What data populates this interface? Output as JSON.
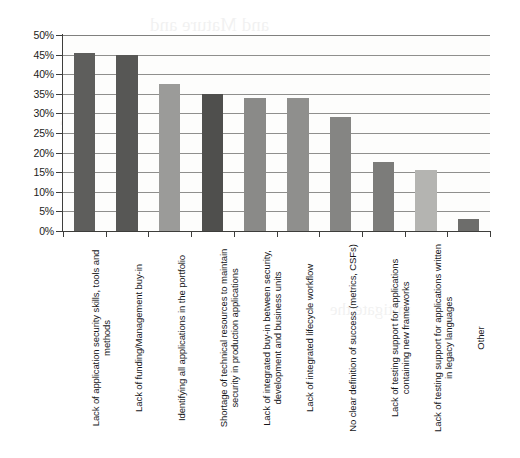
{
  "chart_data": {
    "type": "bar",
    "title": "",
    "subtitle": "",
    "xlabel": "",
    "ylabel": "",
    "ylim": [
      0,
      50
    ],
    "y_tick_labels": [
      "50%",
      "45%",
      "40%",
      "35%",
      "30%",
      "25%",
      "20%",
      "15%",
      "10%",
      "5%",
      "0%"
    ],
    "y_tick_values": [
      50,
      45,
      40,
      35,
      30,
      25,
      20,
      15,
      10,
      5,
      0
    ],
    "grid": true,
    "legend": false,
    "legend_position": "none",
    "value_suffix": "%",
    "categories": [
      "Lack of application security skills, tools and methods",
      "Lack of funding/Management buy-in",
      "Identifying all applications in the portfolio",
      "Shortage of technical resources to maintain security in production applications",
      "Lack of integrated buy-in between security, development and business units",
      "Lack of integrated lifecycle workflow",
      "No clear definition of success (metrics, CSFs)",
      "Lack of testing support for applications containing new frameworks",
      "Lack of testing support for applications written in legacy languages",
      "Other"
    ],
    "values": [
      45.5,
      45,
      37.5,
      35,
      34,
      34,
      29,
      17.5,
      15.5,
      3
    ],
    "bar_colors": [
      "#5e5e5c",
      "#575755",
      "#9b9b99",
      "#4f4f4d",
      "#8a8a88",
      "#8f8f8d",
      "#858583",
      "#7c7c7a",
      "#b4b4b1",
      "#6d6d6b"
    ]
  },
  "style": {
    "axis_color": "#3d3d3b",
    "grid_color": "#6f6f6d",
    "plot_background": "#fdfdfc",
    "page_background": "#ffffff",
    "text_color": "#1a1a1a"
  },
  "scan_artifacts": {
    "bleed_lines": [
      "and Mature and",
      "the Organization",
      "assess the",
      "reduce risk and",
      "build the",
      "mitigate the"
    ]
  }
}
